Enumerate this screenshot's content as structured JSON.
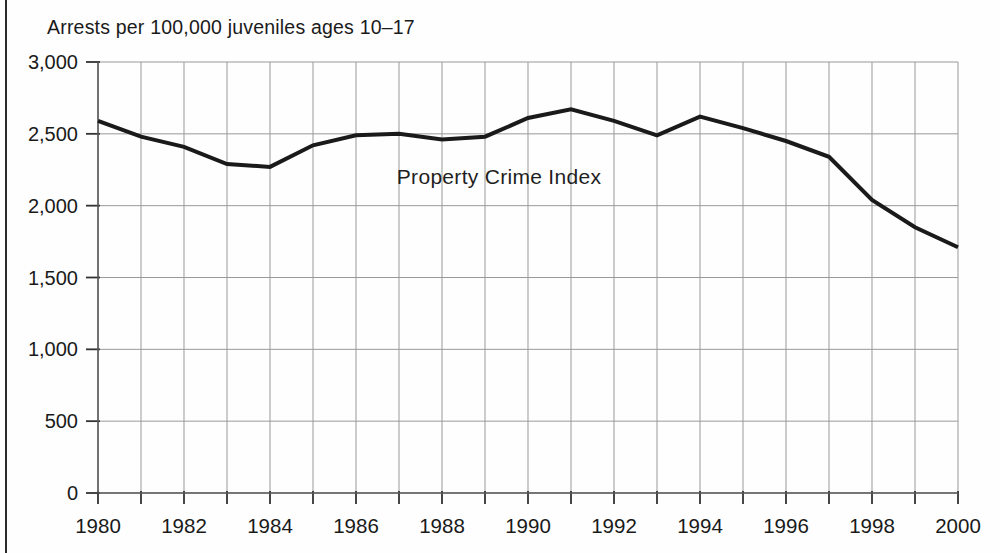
{
  "page": {
    "title": "Arrests per 100,000 juveniles ages 10–17",
    "annotation": "Property Crime Index"
  },
  "chart_data": {
    "type": "line",
    "title": "Arrests per 100,000 juveniles ages 10–17",
    "series_label": "Property Crime Index",
    "x": [
      1980,
      1981,
      1982,
      1983,
      1984,
      1985,
      1986,
      1987,
      1988,
      1989,
      1990,
      1991,
      1992,
      1993,
      1994,
      1995,
      1996,
      1997,
      1998,
      1999,
      2000
    ],
    "values": [
      2590,
      2480,
      2410,
      2290,
      2270,
      2420,
      2490,
      2500,
      2460,
      2480,
      2610,
      2670,
      2590,
      2490,
      2620,
      2540,
      2450,
      2340,
      2040,
      1850,
      1710
    ],
    "xlabel": "",
    "ylabel": "Arrests per 100,000 juveniles ages 10–17",
    "xlim": [
      1980,
      2000
    ],
    "ylim": [
      0,
      3000
    ],
    "y_tick_values": [
      0,
      500,
      1000,
      1500,
      2000,
      2500,
      3000
    ],
    "y_tick_labels": [
      "0",
      "500",
      "1,000",
      "1,500",
      "2,000",
      "2,500",
      "3,000"
    ],
    "x_tick_step": 1,
    "x_label_step": 2,
    "x_tick_labels": [
      "1980",
      "1982",
      "1984",
      "1986",
      "1988",
      "1990",
      "1992",
      "1994",
      "1996",
      "1998",
      "2000"
    ],
    "grid": true,
    "legend_position": "inside-annotation",
    "colors": {
      "line": "#1a1a1a",
      "grid": "#999999",
      "axis": "#5a5a5a",
      "tick": "#333333",
      "text": "#1a1a1a",
      "background": "#fefefe"
    }
  }
}
